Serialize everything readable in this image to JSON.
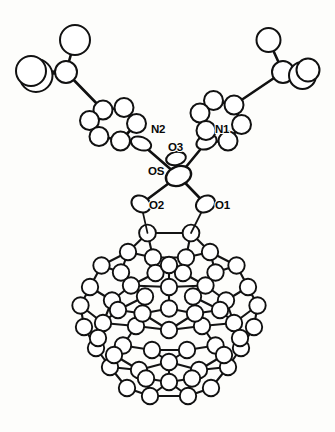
{
  "figure": {
    "background_color": "#fdfdfb",
    "line_color": "#111111",
    "atom_fill_color": "#ffffff",
    "width": 335,
    "height": 432,
    "caption": ""
  },
  "labels": [
    {
      "id": "label-n2",
      "text": "N2",
      "x": 151,
      "y": 133
    },
    {
      "id": "label-n1",
      "text": "N1",
      "x": 215,
      "y": 133
    },
    {
      "id": "label-o3",
      "text": "O3",
      "x": 168,
      "y": 151
    },
    {
      "id": "label-os",
      "text": "OS",
      "x": 148,
      "y": 175
    },
    {
      "id": "label-o2",
      "text": "O2",
      "x": 149,
      "y": 209
    },
    {
      "id": "label-o1",
      "text": "O1",
      "x": 215,
      "y": 209
    }
  ],
  "atoms": [
    {
      "id": "Os",
      "x": 178.5,
      "y": 176.0,
      "rx": 13.0,
      "ry": 9.5,
      "rot": -22,
      "cls": "atom-metal"
    },
    {
      "id": "O3",
      "x": 176.0,
      "y": 158.5,
      "rx": 10.0,
      "ry": 6.5,
      "rot": -12,
      "cls": "atom"
    },
    {
      "id": "O2",
      "x": 141.0,
      "y": 204.0,
      "rx": 10.0,
      "ry": 8.0,
      "rot": 30,
      "cls": "atom"
    },
    {
      "id": "O1",
      "x": 205.5,
      "y": 204.0,
      "rx": 10.0,
      "ry": 8.0,
      "rot": -30,
      "cls": "atom"
    },
    {
      "id": "N2",
      "x": 141.0,
      "y": 143.5,
      "rx": 10.5,
      "ry": 6.5,
      "rot": 20,
      "cls": "atom"
    },
    {
      "id": "N1",
      "x": 206.5,
      "y": 142.0,
      "rx": 10.5,
      "ry": 7.0,
      "rot": -22,
      "cls": "atom"
    },
    {
      "id": "C1L",
      "x": 120.5,
      "y": 141.0,
      "rx": 9.5,
      "ry": 9.5,
      "rot": 0,
      "cls": "atom"
    },
    {
      "id": "C2L",
      "x": 136.5,
      "y": 123.5,
      "rx": 9.5,
      "ry": 9.5,
      "rot": 0,
      "cls": "atom"
    },
    {
      "id": "C3L",
      "x": 124.0,
      "y": 107.5,
      "rx": 9.5,
      "ry": 9.5,
      "rot": 0,
      "cls": "atom"
    },
    {
      "id": "C4L",
      "x": 103.0,
      "y": 110.0,
      "rx": 9.5,
      "ry": 9.5,
      "rot": 0,
      "cls": "atom"
    },
    {
      "id": "C5L",
      "x": 89.5,
      "y": 120.5,
      "rx": 9.5,
      "ry": 9.5,
      "rot": 0,
      "cls": "atom"
    },
    {
      "id": "C6L",
      "x": 99.0,
      "y": 136.5,
      "rx": 9.5,
      "ry": 9.5,
      "rot": 0,
      "cls": "atom"
    },
    {
      "id": "CqL",
      "x": 66.0,
      "y": 72.0,
      "rx": 11.0,
      "ry": 11.0,
      "rot": 0,
      "cls": "atom"
    },
    {
      "id": "Me1L",
      "x": 75.0,
      "y": 40.0,
      "rx": 15.0,
      "ry": 15.0,
      "rot": 0,
      "cls": "atom"
    },
    {
      "id": "Me2L",
      "x": 36.0,
      "y": 75.5,
      "rx": 16.5,
      "ry": 16.5,
      "rot": 0,
      "cls": "atom"
    },
    {
      "id": "Me3L",
      "x": 31.0,
      "y": 71.0,
      "rx": 15.0,
      "ry": 15.0,
      "rot": 0,
      "cls": "atom"
    },
    {
      "id": "C1R",
      "x": 228.0,
      "y": 141.0,
      "rx": 9.5,
      "ry": 9.5,
      "rot": 0,
      "cls": "atom"
    },
    {
      "id": "C2R",
      "x": 241.5,
      "y": 124.5,
      "rx": 9.5,
      "ry": 9.5,
      "rot": 0,
      "cls": "atom"
    },
    {
      "id": "C3R",
      "x": 234.0,
      "y": 105.0,
      "rx": 9.5,
      "ry": 9.5,
      "rot": 0,
      "cls": "atom"
    },
    {
      "id": "C4R",
      "x": 213.5,
      "y": 100.5,
      "rx": 9.5,
      "ry": 9.5,
      "rot": 0,
      "cls": "atom"
    },
    {
      "id": "C5R",
      "x": 200.0,
      "y": 113.0,
      "rx": 9.5,
      "ry": 9.5,
      "rot": 0,
      "cls": "atom"
    },
    {
      "id": "C6R",
      "x": 206.0,
      "y": 130.5,
      "rx": 9.5,
      "ry": 9.5,
      "rot": 0,
      "cls": "atom"
    },
    {
      "id": "CqR",
      "x": 283.0,
      "y": 72.0,
      "rx": 11.0,
      "ry": 11.0,
      "rot": 0,
      "cls": "atom"
    },
    {
      "id": "Me1R",
      "x": 268.5,
      "y": 40.0,
      "rx": 12.0,
      "ry": 12.0,
      "rot": 0,
      "cls": "atom"
    },
    {
      "id": "Me2R",
      "x": 302.5,
      "y": 75.5,
      "rx": 13.5,
      "ry": 13.5,
      "rot": 0,
      "cls": "atom"
    },
    {
      "id": "Me3R",
      "x": 308.0,
      "y": 70.0,
      "rx": 11.5,
      "ry": 11.5,
      "rot": 0,
      "cls": "atom"
    }
  ],
  "bonds": [
    {
      "a": "Os",
      "b": "O3",
      "w": 2.6
    },
    {
      "a": "Os",
      "b": "O1",
      "w": 2.6
    },
    {
      "a": "Os",
      "b": "O2",
      "w": 2.6
    },
    {
      "a": "Os",
      "b": "N1",
      "w": 2.6
    },
    {
      "a": "Os",
      "b": "N2",
      "w": 2.6
    },
    {
      "a": "N2",
      "b": "C1L",
      "w": 2.2
    },
    {
      "a": "C1L",
      "b": "C2L",
      "w": 2.2
    },
    {
      "a": "C2L",
      "b": "C3L",
      "w": 2.2
    },
    {
      "a": "C3L",
      "b": "C4L",
      "w": 2.2
    },
    {
      "a": "C4L",
      "b": "C5L",
      "w": 2.2
    },
    {
      "a": "C5L",
      "b": "C6L",
      "w": 2.2
    },
    {
      "a": "C6L",
      "b": "N2",
      "w": 2.2
    },
    {
      "a": "C4L",
      "b": "CqL",
      "w": 2.4
    },
    {
      "a": "CqL",
      "b": "Me1L",
      "w": 2.4
    },
    {
      "a": "CqL",
      "b": "Me2L",
      "w": 2.4
    },
    {
      "a": "CqL",
      "b": "Me3L",
      "w": 2.0
    },
    {
      "a": "N1",
      "b": "C1R",
      "w": 2.2
    },
    {
      "a": "C1R",
      "b": "C2R",
      "w": 2.2
    },
    {
      "a": "C2R",
      "b": "C3R",
      "w": 2.2
    },
    {
      "a": "C3R",
      "b": "C4R",
      "w": 2.2
    },
    {
      "a": "C4R",
      "b": "C5R",
      "w": 2.2
    },
    {
      "a": "C5R",
      "b": "C6R",
      "w": 2.2
    },
    {
      "a": "C6R",
      "b": "N1",
      "w": 2.2
    },
    {
      "a": "C3R",
      "b": "CqR",
      "w": 2.4
    },
    {
      "a": "CqR",
      "b": "Me1R",
      "w": 2.4
    },
    {
      "a": "CqR",
      "b": "Me2R",
      "w": 2.4
    },
    {
      "a": "CqR",
      "b": "Me3R",
      "w": 2.0
    }
  ],
  "cage": {
    "description": "C60 fullerene cage drawn as open circles joined by bonds",
    "center_x": 168,
    "center_y": 322,
    "radius_x": 93,
    "radius_y": 97,
    "atom_radius": 8.2,
    "bond_width": 2.0,
    "attachment_atoms": [
      "Ca",
      "Cb"
    ],
    "vertices": [
      {
        "id": "Ca",
        "x": 147.5,
        "y": 233.0,
        "r": 8.4
      },
      {
        "id": "Cb",
        "x": 191.0,
        "y": 233.0,
        "r": 8.4
      },
      {
        "id": "T1",
        "x": 128.0,
        "y": 252.0,
        "r": 8.2
      },
      {
        "id": "T2",
        "x": 153.0,
        "y": 257.5,
        "r": 8.2
      },
      {
        "id": "T3",
        "x": 186.0,
        "y": 257.5,
        "r": 8.2
      },
      {
        "id": "T4",
        "x": 210.0,
        "y": 252.0,
        "r": 8.2
      },
      {
        "id": "T5",
        "x": 215.5,
        "y": 272.5,
        "r": 8.2
      },
      {
        "id": "T6",
        "x": 121.0,
        "y": 272.5,
        "r": 8.2
      },
      {
        "id": "U1",
        "x": 101.5,
        "y": 265.5,
        "r": 8.2
      },
      {
        "id": "U2",
        "x": 236.5,
        "y": 265.5,
        "r": 8.2
      },
      {
        "id": "U3",
        "x": 90.0,
        "y": 287.0,
        "r": 8.2
      },
      {
        "id": "U4",
        "x": 248.0,
        "y": 287.0,
        "r": 8.2
      },
      {
        "id": "U5",
        "x": 80.5,
        "y": 305.5,
        "r": 8.2
      },
      {
        "id": "U6",
        "x": 257.5,
        "y": 305.5,
        "r": 8.2
      },
      {
        "id": "M1",
        "x": 131.0,
        "y": 285.5,
        "r": 8.2
      },
      {
        "id": "M2",
        "x": 169.0,
        "y": 287.0,
        "r": 8.2
      },
      {
        "id": "M3",
        "x": 205.5,
        "y": 285.5,
        "r": 8.2
      },
      {
        "id": "M4",
        "x": 112.0,
        "y": 300.5,
        "r": 8.2
      },
      {
        "id": "M5",
        "x": 226.0,
        "y": 300.5,
        "r": 8.2
      },
      {
        "id": "M6",
        "x": 169.0,
        "y": 308.5,
        "r": 8.2
      },
      {
        "id": "N3",
        "x": 103.0,
        "y": 323.0,
        "r": 8.2
      },
      {
        "id": "N4",
        "x": 234.0,
        "y": 323.0,
        "r": 8.2
      },
      {
        "id": "N5",
        "x": 84.0,
        "y": 327.0,
        "r": 8.2
      },
      {
        "id": "N6",
        "x": 254.0,
        "y": 327.0,
        "r": 8.2
      },
      {
        "id": "P1",
        "x": 136.0,
        "y": 326.0,
        "r": 8.2
      },
      {
        "id": "P2",
        "x": 169.0,
        "y": 330.0,
        "r": 8.2
      },
      {
        "id": "P3",
        "x": 202.0,
        "y": 326.0,
        "r": 8.2
      },
      {
        "id": "Q1",
        "x": 123.0,
        "y": 345.5,
        "r": 8.2
      },
      {
        "id": "Q2",
        "x": 152.0,
        "y": 350.0,
        "r": 8.2
      },
      {
        "id": "Q3",
        "x": 187.0,
        "y": 350.0,
        "r": 8.2
      },
      {
        "id": "Q4",
        "x": 215.5,
        "y": 345.5,
        "r": 8.2
      },
      {
        "id": "Q5",
        "x": 96.0,
        "y": 348.0,
        "r": 8.2
      },
      {
        "id": "Q6",
        "x": 241.0,
        "y": 348.0,
        "r": 8.2
      },
      {
        "id": "R1",
        "x": 110.0,
        "y": 367.0,
        "r": 8.2
      },
      {
        "id": "R2",
        "x": 228.0,
        "y": 367.0,
        "r": 8.2
      },
      {
        "id": "R3",
        "x": 139.0,
        "y": 370.0,
        "r": 8.2
      },
      {
        "id": "R4",
        "x": 199.0,
        "y": 370.0,
        "r": 8.2
      },
      {
        "id": "R5",
        "x": 169.0,
        "y": 362.0,
        "r": 8.2
      },
      {
        "id": "S1",
        "x": 127.0,
        "y": 388.0,
        "r": 8.2
      },
      {
        "id": "S2",
        "x": 211.0,
        "y": 388.0,
        "r": 8.2
      },
      {
        "id": "S3",
        "x": 150.0,
        "y": 396.0,
        "r": 8.2
      },
      {
        "id": "S4",
        "x": 188.0,
        "y": 396.0,
        "r": 8.2
      },
      {
        "id": "S5",
        "x": 169.0,
        "y": 382.0,
        "r": 8.2
      },
      {
        "id": "B1",
        "x": 146.0,
        "y": 378.5,
        "r": 8.2
      },
      {
        "id": "B2",
        "x": 192.0,
        "y": 378.5,
        "r": 8.2
      },
      {
        "id": "W1",
        "x": 118.0,
        "y": 310.0,
        "r": 8.2
      },
      {
        "id": "W2",
        "x": 220.0,
        "y": 310.0,
        "r": 8.2
      },
      {
        "id": "W3",
        "x": 98.0,
        "y": 338.0,
        "r": 8.2
      },
      {
        "id": "W4",
        "x": 240.0,
        "y": 338.0,
        "r": 8.2
      },
      {
        "id": "W5",
        "x": 114.0,
        "y": 355.0,
        "r": 8.2
      },
      {
        "id": "W6",
        "x": 224.0,
        "y": 355.0,
        "r": 8.2
      },
      {
        "id": "W7",
        "x": 142.5,
        "y": 313.5,
        "r": 8.2
      },
      {
        "id": "W8",
        "x": 195.0,
        "y": 313.5,
        "r": 8.2
      },
      {
        "id": "W9",
        "x": 155.5,
        "y": 273.0,
        "r": 8.2
      },
      {
        "id": "W10",
        "x": 183.0,
        "y": 273.0,
        "r": 8.2
      },
      {
        "id": "W11",
        "x": 169.0,
        "y": 265.0,
        "r": 8.2
      },
      {
        "id": "W12",
        "x": 145.0,
        "y": 296.5,
        "r": 8.2
      },
      {
        "id": "W13",
        "x": 193.0,
        "y": 296.5,
        "r": 8.2
      }
    ],
    "edges": [
      [
        "Ca",
        "Cb"
      ],
      [
        "Ca",
        "T1"
      ],
      [
        "Ca",
        "T2"
      ],
      [
        "Cb",
        "T3"
      ],
      [
        "Cb",
        "T4"
      ],
      [
        "T1",
        "T2"
      ],
      [
        "T2",
        "W9"
      ],
      [
        "T3",
        "W10"
      ],
      [
        "T3",
        "T4"
      ],
      [
        "T2",
        "T3"
      ],
      [
        "T1",
        "T6"
      ],
      [
        "T4",
        "T5"
      ],
      [
        "T1",
        "U1"
      ],
      [
        "T4",
        "U2"
      ],
      [
        "T6",
        "U1"
      ],
      [
        "T5",
        "U2"
      ],
      [
        "U1",
        "U3"
      ],
      [
        "U2",
        "U4"
      ],
      [
        "U3",
        "U5"
      ],
      [
        "U4",
        "U6"
      ],
      [
        "U3",
        "M4"
      ],
      [
        "U4",
        "M5"
      ],
      [
        "T6",
        "M1"
      ],
      [
        "T5",
        "M3"
      ],
      [
        "M1",
        "M2"
      ],
      [
        "M2",
        "M3"
      ],
      [
        "W9",
        "W11"
      ],
      [
        "W10",
        "W11"
      ],
      [
        "W9",
        "M1"
      ],
      [
        "W10",
        "M3"
      ],
      [
        "W11",
        "M2"
      ],
      [
        "M2",
        "M6"
      ],
      [
        "M1",
        "M4"
      ],
      [
        "M3",
        "M5"
      ],
      [
        "M4",
        "W1"
      ],
      [
        "M5",
        "W2"
      ],
      [
        "M4",
        "N3"
      ],
      [
        "M5",
        "N4"
      ],
      [
        "U5",
        "N5"
      ],
      [
        "U6",
        "N6"
      ],
      [
        "U5",
        "N3"
      ],
      [
        "U6",
        "N4"
      ],
      [
        "M6",
        "W7"
      ],
      [
        "M6",
        "W8"
      ],
      [
        "W7",
        "W12"
      ],
      [
        "W8",
        "W13"
      ],
      [
        "W12",
        "M1"
      ],
      [
        "W13",
        "M3"
      ],
      [
        "W12",
        "P1"
      ],
      [
        "W13",
        "P3"
      ],
      [
        "W7",
        "P2"
      ],
      [
        "W8",
        "P2"
      ],
      [
        "P1",
        "P2"
      ],
      [
        "P2",
        "P3"
      ],
      [
        "N3",
        "P1"
      ],
      [
        "N4",
        "P3"
      ],
      [
        "N3",
        "W3"
      ],
      [
        "N4",
        "W4"
      ],
      [
        "N5",
        "W3"
      ],
      [
        "N6",
        "W4"
      ],
      [
        "N5",
        "Q5"
      ],
      [
        "N6",
        "Q6"
      ],
      [
        "W3",
        "Q5"
      ],
      [
        "W4",
        "Q6"
      ],
      [
        "P1",
        "Q1"
      ],
      [
        "P3",
        "Q4"
      ],
      [
        "Q1",
        "Q2"
      ],
      [
        "Q3",
        "Q4"
      ],
      [
        "Q2",
        "R5"
      ],
      [
        "Q3",
        "R5"
      ],
      [
        "Q2",
        "Q3"
      ],
      [
        "Q1",
        "W5"
      ],
      [
        "Q4",
        "W6"
      ],
      [
        "Q5",
        "R1"
      ],
      [
        "Q6",
        "R2"
      ],
      [
        "W5",
        "R1"
      ],
      [
        "W6",
        "R2"
      ],
      [
        "W5",
        "R3"
      ],
      [
        "W6",
        "R4"
      ],
      [
        "R1",
        "R3"
      ],
      [
        "R2",
        "R4"
      ],
      [
        "R3",
        "R5"
      ],
      [
        "R4",
        "R5"
      ],
      [
        "R5",
        "S5"
      ],
      [
        "R3",
        "B1"
      ],
      [
        "R4",
        "B2"
      ],
      [
        "B1",
        "S5"
      ],
      [
        "B2",
        "S5"
      ],
      [
        "B1",
        "S3"
      ],
      [
        "B2",
        "S4"
      ],
      [
        "R1",
        "S1"
      ],
      [
        "R2",
        "S2"
      ],
      [
        "S1",
        "S3"
      ],
      [
        "S2",
        "S4"
      ],
      [
        "S3",
        "S4"
      ],
      [
        "S5",
        "S3"
      ],
      [
        "S5",
        "S4"
      ],
      [
        "W1",
        "W12"
      ],
      [
        "W2",
        "W13"
      ],
      [
        "W1",
        "W7"
      ],
      [
        "W2",
        "W8"
      ],
      [
        "W1",
        "N3"
      ],
      [
        "W2",
        "N4"
      ]
    ]
  },
  "ester_bridge": {
    "bonds": [
      {
        "from": "O2",
        "to_cage": "Ca"
      },
      {
        "from": "O1",
        "to_cage": "Cb"
      }
    ]
  }
}
